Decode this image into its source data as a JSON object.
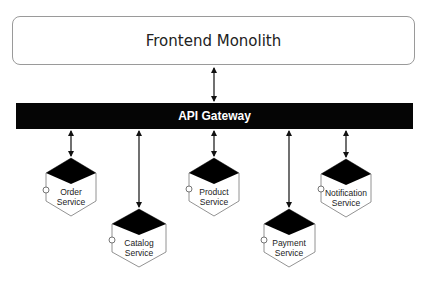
{
  "diagram": {
    "frontend": {
      "label": "Frontend Monolith"
    },
    "gateway": {
      "label": "API Gateway"
    },
    "services": [
      {
        "id": "order",
        "line1": "Order",
        "line2": "Service"
      },
      {
        "id": "catalog",
        "line1": "Catalog",
        "line2": "Service"
      },
      {
        "id": "product",
        "line1": "Product",
        "line2": "Service"
      },
      {
        "id": "payment",
        "line1": "Payment",
        "line2": "Service"
      },
      {
        "id": "notification",
        "line1": "Notification",
        "line2": "Service"
      }
    ],
    "edges": [
      {
        "from": "Frontend Monolith",
        "to": "API Gateway",
        "bidirectional": true
      },
      {
        "from": "API Gateway",
        "to": "Order Service",
        "bidirectional": true
      },
      {
        "from": "API Gateway",
        "to": "Catalog Service",
        "bidirectional": true
      },
      {
        "from": "API Gateway",
        "to": "Product Service",
        "bidirectional": true
      },
      {
        "from": "API Gateway",
        "to": "Payment Service",
        "bidirectional": true
      },
      {
        "from": "API Gateway",
        "to": "Notification Service",
        "bidirectional": true
      }
    ],
    "colors": {
      "gateway_fill": "#050505",
      "gateway_text": "#ffffff",
      "box_border": "#9a9a9a",
      "cube_top": "#000000"
    }
  }
}
